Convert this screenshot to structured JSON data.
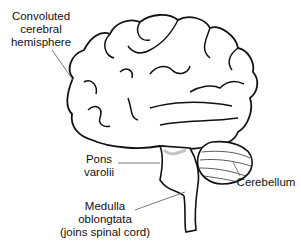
{
  "diagram": {
    "labels": {
      "cerebral_hemisphere": {
        "line1": "Convoluted",
        "line2": "cerebral",
        "line3": "hemisphere"
      },
      "pons": {
        "line1": "Pons",
        "line2": "varolii"
      },
      "cerebellum": {
        "line1": "Cerebellum"
      },
      "medulla": {
        "line1": "Medulla",
        "line2": "oblongtata",
        "line3": "(joins spinal cord)"
      }
    }
  },
  "colors": {
    "ink": "#111111",
    "leader": "#555555",
    "background": "#ffffff"
  }
}
